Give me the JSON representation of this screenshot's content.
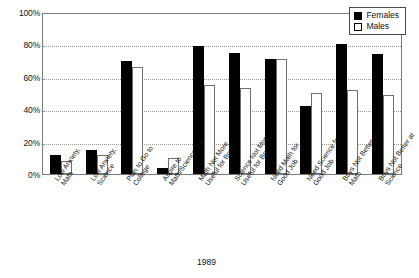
{
  "chart_data": {
    "type": "bar",
    "title": "",
    "subtitle": "",
    "caption": "1989",
    "xlabel": "",
    "ylabel": "",
    "ylim": [
      0,
      100
    ],
    "yticks": [
      "0%",
      "20%",
      "40%",
      "60%",
      "80%",
      "100%"
    ],
    "ytick_values": [
      0,
      20,
      40,
      60,
      80,
      100
    ],
    "grid": "horizontal-dotted",
    "legend_position": "top-right",
    "categories": [
      "Low Anxiety, Math",
      "Low Anxiety, Science",
      "Plan to Go to College",
      "Aspire to Math/Science Job",
      "Math Not More Useful for Boys",
      "Science Not More Useful for Boys",
      "Need Math for Good Job",
      "Need Science for Good Job",
      "Boys Not Better at Math",
      "Boys Not Better at Science"
    ],
    "category_lines": [
      [
        "Low Anxiety,",
        "Math"
      ],
      [
        "Low Anxiety,",
        "Science"
      ],
      [
        "Plan to Go to",
        "College"
      ],
      [
        "Aspire to",
        "Math/Science Job"
      ],
      [
        "Math Not More",
        "Useful for Boys"
      ],
      [
        "Science Not More",
        "Useful for Boys"
      ],
      [
        "Need Math for",
        "Good Job"
      ],
      [
        "Need Science for",
        "Good Job"
      ],
      [
        "Boys Not Better at",
        "Math"
      ],
      [
        "Boys Not Better at",
        "Science"
      ]
    ],
    "series": [
      {
        "name": "Females",
        "color": "#000000",
        "values": [
          12,
          15,
          70,
          4,
          79,
          75,
          71,
          42,
          80,
          74
        ]
      },
      {
        "name": "Males",
        "color": "#ffffff",
        "values": [
          8,
          12,
          66,
          10,
          55,
          53,
          71,
          50,
          52,
          49
        ]
      }
    ]
  },
  "legend": {
    "items": [
      {
        "label": "Females",
        "swatch": "filled-black-square"
      },
      {
        "label": "Males",
        "swatch": "empty-square"
      }
    ]
  }
}
